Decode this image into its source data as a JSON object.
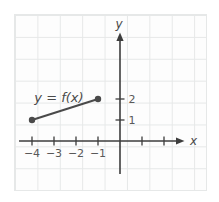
{
  "figure": {
    "x_axis_label": "x",
    "y_axis_label": "y",
    "curve_label": "y = f(x)"
  },
  "colors": {
    "axis": "#3d3d3d",
    "curve": "#4a4a4a",
    "gridline": "#e6e8e8",
    "tick_text": "#595959"
  },
  "chart_data": {
    "type": "line",
    "title": "",
    "xlabel": "x",
    "ylabel": "y",
    "grid": true,
    "xlim": [
      -4.8,
      3.9
    ],
    "ylim": [
      -2.3,
      6.0
    ],
    "x_ticks": [
      {
        "v": -4,
        "label": "−4"
      },
      {
        "v": -3,
        "label": "−3"
      },
      {
        "v": -2,
        "label": "−2"
      },
      {
        "v": -1,
        "label": "−1"
      },
      {
        "v": 1,
        "label": ""
      },
      {
        "v": 2,
        "label": ""
      }
    ],
    "y_ticks": [
      {
        "v": 1,
        "label": "1"
      },
      {
        "v": 2,
        "label": "2"
      }
    ],
    "series": [
      {
        "name": "y = f(x)",
        "points": [
          [
            -4,
            1
          ],
          [
            -1,
            2
          ]
        ],
        "endpoint_style": "closed-dot"
      }
    ]
  }
}
